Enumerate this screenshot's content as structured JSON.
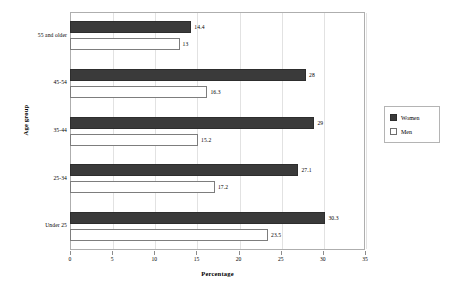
{
  "chart_data": {
    "type": "bar",
    "orientation": "horizontal",
    "title": "",
    "xlabel": "Percentage",
    "ylabel": "Age group",
    "xlim": [
      0,
      35
    ],
    "xticks": [
      0,
      5,
      10,
      15,
      20,
      25,
      30,
      35
    ],
    "xtick_labels": [
      "0",
      "5",
      "10",
      "15",
      "20",
      "25",
      "30",
      "35"
    ],
    "grid": "vertical",
    "legend_position": "right",
    "categories": [
      "55 and older",
      "45-54",
      "35-44",
      "25-34",
      "Under 25"
    ],
    "series": [
      {
        "name": "Women",
        "color": "#3a3a3a",
        "values": [
          14.4,
          28,
          29,
          27.1,
          30.3
        ],
        "value_labels": [
          "14.4",
          "28",
          "29",
          "27.1",
          "30.3"
        ]
      },
      {
        "name": "Men",
        "color": "#ffffff",
        "values": [
          13,
          16.3,
          15.2,
          17.2,
          23.5
        ],
        "value_labels": [
          "13",
          "16.3",
          "15.2",
          "17.2",
          "23.5"
        ]
      }
    ]
  },
  "legend": {
    "entries": [
      {
        "label": "Women",
        "swatch": "filled-dark-square"
      },
      {
        "label": "Men",
        "swatch": "empty-white-square"
      }
    ]
  },
  "axes": {
    "x_title": "Percentage",
    "y_title": "Age group"
  }
}
